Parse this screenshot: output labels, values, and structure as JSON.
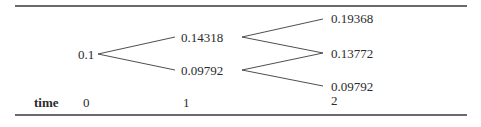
{
  "tree": {
    "nodes": {
      "t0": {
        "value": "0.1"
      },
      "t1_up": {
        "value": "0.14318"
      },
      "t1_down": {
        "value": "0.09792"
      },
      "t2_up": {
        "value": "0.19368"
      },
      "t2_mid": {
        "value": "0.13772"
      },
      "t2_down": {
        "value": "0.09792"
      }
    },
    "time_axis": {
      "label": "time",
      "ticks": [
        "0",
        "1",
        "2"
      ]
    }
  },
  "colors": {
    "line": "#3a3a3a",
    "rule": "#6a6a6a",
    "text": "#2b2b2b"
  }
}
